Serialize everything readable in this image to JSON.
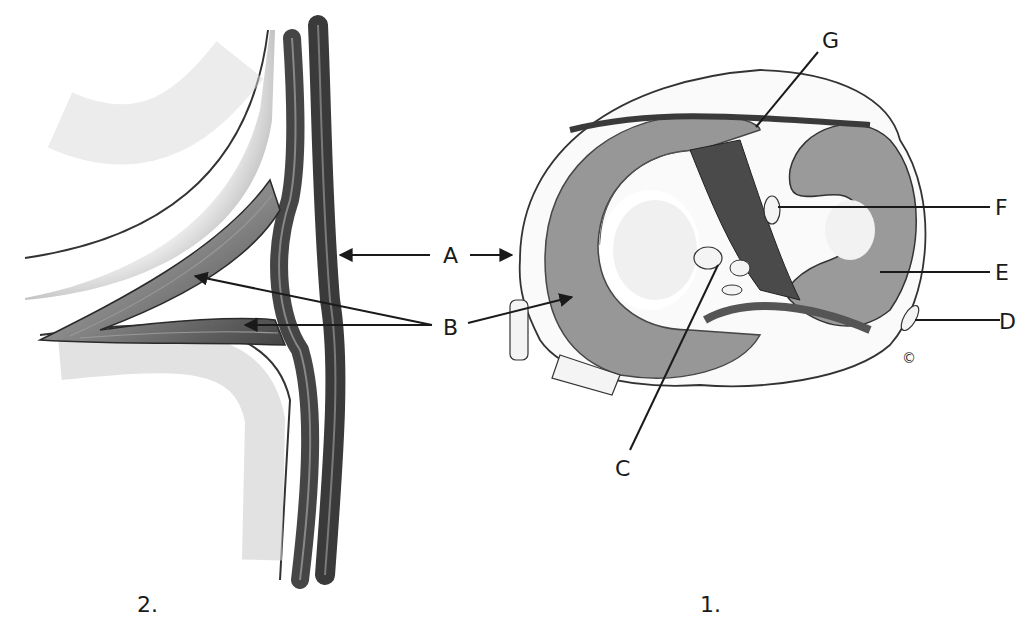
{
  "figures": [
    {
      "id": "fig1",
      "caption": "1.",
      "subject": "meniscus-top-view"
    },
    {
      "id": "fig2",
      "caption": "2.",
      "subject": "meniscus-cross-section"
    }
  ],
  "labels": {
    "A": "A",
    "B": "B",
    "C": "C",
    "D": "D",
    "E": "E",
    "F": "F",
    "G": "G"
  },
  "copyright": "©",
  "colors": {
    "ink": "#1a1a1a",
    "tissue_dark": "#3a3a3a",
    "tissue_mid": "#6b6b6b",
    "shade": "#bdbdbd",
    "background": "#ffffff"
  }
}
